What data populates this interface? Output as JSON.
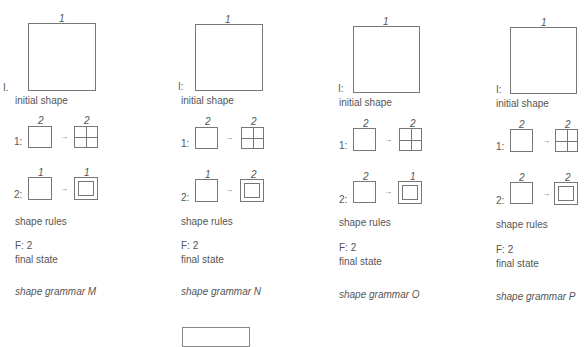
{
  "grammars": [
    {
      "id": "M",
      "initial_label": "I.",
      "initial_num": "1",
      "initial_shape_label": "initial shape",
      "rule1": {
        "prefix": "1:",
        "lhs_num": "2",
        "rhs_num": "2"
      },
      "rule2": {
        "prefix": "2:",
        "lhs_num": "1",
        "rhs_num": "1"
      },
      "rules_label": "shape rules",
      "final": "F: 2",
      "final_label": "final state",
      "title": "shape grammar M"
    },
    {
      "id": "N",
      "initial_label": "I:",
      "initial_num": "1",
      "initial_shape_label": "initial shape",
      "rule1": {
        "prefix": "1:",
        "lhs_num": "2",
        "rhs_num": "2"
      },
      "rule2": {
        "prefix": "2:",
        "lhs_num": "1",
        "rhs_num": "2"
      },
      "rules_label": "shape rules",
      "final": "F: 2",
      "final_label": "final state",
      "title": "shape grammar N"
    },
    {
      "id": "O",
      "initial_label": "I:",
      "initial_num": "1",
      "initial_shape_label": "initial shape",
      "rule1": {
        "prefix": "1:",
        "lhs_num": "2",
        "rhs_num": "2"
      },
      "rule2": {
        "prefix": "2:",
        "lhs_num": "2",
        "rhs_num": "1"
      },
      "rules_label": "shape rules",
      "final": "F: 2",
      "final_label": "final state",
      "title": "shape grammar O"
    },
    {
      "id": "P",
      "initial_label": "I:",
      "initial_num": "1",
      "initial_shape_label": "initial shape",
      "rule1": {
        "prefix": "1:",
        "lhs_num": "2",
        "rhs_num": "2"
      },
      "rule2": {
        "prefix": "2:",
        "lhs_num": "2",
        "rhs_num": "2"
      },
      "rules_label": "shape rules",
      "final": "F: 2",
      "final_label": "final state",
      "title": "shape grammar P"
    }
  ],
  "arrow_glyph": "→"
}
